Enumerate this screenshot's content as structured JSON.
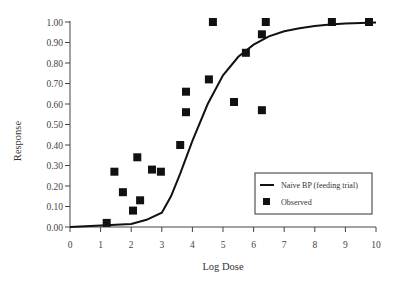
{
  "chart_data": {
    "type": "scatter",
    "title": "",
    "xlabel": "Log Dose",
    "ylabel": "Response",
    "xlim": [
      0,
      10
    ],
    "ylim": [
      0,
      1.0
    ],
    "grid": false,
    "legend_position": "lower right",
    "x_ticks": [
      "0",
      "1",
      "2",
      "3",
      "4",
      "5",
      "6",
      "7",
      "8",
      "9",
      "10"
    ],
    "y_ticks": [
      "0.00",
      "0.10",
      "0.20",
      "0.30",
      "0.40",
      "0.50",
      "0.60",
      "0.70",
      "0.80",
      "0.90",
      "1.00"
    ],
    "series": [
      {
        "name": "Naive BP (feeding trial)",
        "type": "line",
        "color": "#111111",
        "x": [
          0,
          1,
          2,
          2.5,
          3,
          3.3,
          3.6,
          4,
          4.5,
          5,
          5.5,
          6,
          6.5,
          7,
          7.5,
          8,
          8.5,
          9,
          9.5,
          10
        ],
        "y": [
          0.0,
          0.008,
          0.015,
          0.035,
          0.07,
          0.15,
          0.26,
          0.42,
          0.6,
          0.74,
          0.83,
          0.89,
          0.93,
          0.955,
          0.97,
          0.98,
          0.988,
          0.992,
          0.995,
          0.997
        ]
      },
      {
        "name": "Observed",
        "type": "scatter",
        "marker": "square",
        "color": "#111111",
        "x": [
          1.2,
          1.45,
          1.73,
          2.06,
          2.2,
          2.29,
          2.68,
          2.97,
          3.6,
          3.79,
          3.79,
          4.54,
          4.67,
          5.36,
          5.75,
          6.27,
          6.27,
          6.4,
          8.56,
          9.77
        ],
        "y": [
          0.02,
          0.27,
          0.17,
          0.08,
          0.34,
          0.13,
          0.28,
          0.27,
          0.4,
          0.56,
          0.66,
          0.72,
          1.0,
          0.61,
          0.85,
          0.94,
          0.57,
          1.0,
          1.0,
          1.0
        ]
      }
    ]
  },
  "legend": {
    "items": [
      {
        "label": "Naive BP (feeding trial)",
        "symbol": "line"
      },
      {
        "label": "Observed",
        "symbol": "square"
      }
    ]
  }
}
